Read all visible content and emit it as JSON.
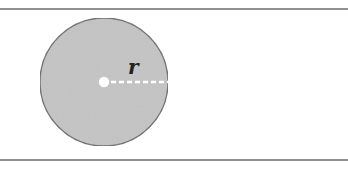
{
  "diagram": {
    "title": "",
    "radius_label": "r",
    "colors": {
      "circle_fill": "#c4c4c4",
      "circle_stroke": "#6e6e6e",
      "rule_line": "#6a6a6a",
      "radius_line": "#ffffff",
      "center_dot": "#ffffff",
      "label": "#222222",
      "background": "#ffffff"
    },
    "shapes": {
      "circle": {
        "cx": 104,
        "cy": 82,
        "r": 64
      },
      "center_point": {
        "cx": 104,
        "cy": 82,
        "r": 5
      },
      "radius_line": {
        "x1": 109,
        "y1": 82,
        "x2": 168,
        "y2": 82,
        "dashed": true
      },
      "top_rule": {
        "y": 9
      },
      "bottom_rule": {
        "y": 160
      }
    }
  }
}
